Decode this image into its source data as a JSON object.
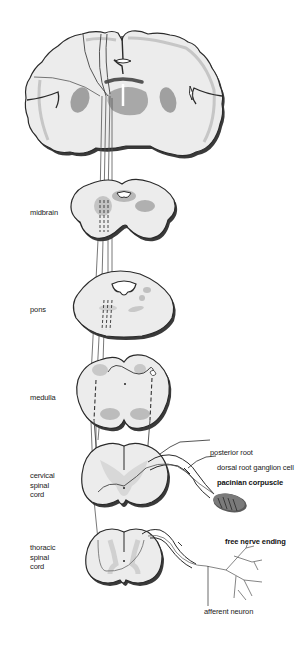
{
  "diagram": {
    "type": "anatomical pathway diagram",
    "colors": {
      "tissue_fill": "#ececec",
      "outline": "#2a2a2a",
      "shadow": "#555555",
      "nuclei": "#a8a8a8",
      "pathway": "#444444",
      "corpuscle": "#7a7a7a"
    },
    "sections": [
      {
        "id": "cerebrum",
        "label": ""
      },
      {
        "id": "midbrain",
        "label": "midbrain"
      },
      {
        "id": "pons",
        "label": "pons"
      },
      {
        "id": "medulla",
        "label": "medulla"
      },
      {
        "id": "cervical",
        "label_lines": [
          "cervical",
          "spinal",
          "cord"
        ]
      },
      {
        "id": "thoracic",
        "label_lines": [
          "thoracic",
          "spinal",
          "cord"
        ]
      }
    ],
    "callouts": {
      "posterior_root": "posterior root",
      "dorsal_root_ganglion": "dorsal root ganglion cell",
      "pacinian_corpuscle": "pacinian corpuscle",
      "free_nerve_ending": "free nerve ending",
      "afferent_neuron": "afferent neuron"
    }
  }
}
